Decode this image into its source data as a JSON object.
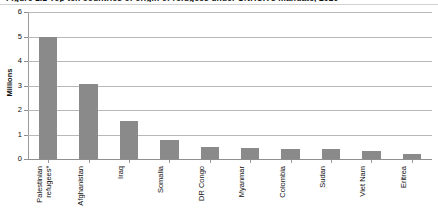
{
  "chart_data": {
    "type": "bar",
    "title": "Figure 1.1 Top ten countries of origin of refugees under UNHCR's mandate, 2010",
    "subtitle": "",
    "xlabel": "",
    "ylabel": "Millions",
    "ylim": [
      0,
      6
    ],
    "yticks": [
      0,
      1,
      2,
      3,
      4,
      5,
      6
    ],
    "ytick_labels": [
      "0",
      "1",
      "2",
      "3",
      "4",
      "5",
      "6"
    ],
    "grid": true,
    "legend": "none",
    "categories": [
      "Palestinian\nrefugees*",
      "Afghanistan",
      "Iraq",
      "Somalia",
      "DR Congo",
      "Myanmar",
      "Colombia",
      "Sudan",
      "Viet Nam",
      "Eritrea"
    ],
    "values": [
      5.0,
      3.05,
      1.55,
      0.78,
      0.48,
      0.44,
      0.4,
      0.4,
      0.34,
      0.21
    ],
    "bar_color": "#8a8a8a",
    "gridline_color": "#b8b8b8",
    "axis_color": "#8f8f8f"
  }
}
